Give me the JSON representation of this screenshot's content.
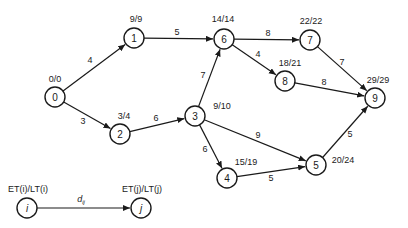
{
  "diagram": {
    "type": "activity-network",
    "nodes": [
      {
        "id": "0",
        "label": "0",
        "times": "0/0",
        "x": 55,
        "y": 97,
        "tx": 55,
        "ty": 79
      },
      {
        "id": "1",
        "label": "1",
        "times": "9/9",
        "x": 134,
        "y": 38,
        "tx": 136,
        "ty": 19
      },
      {
        "id": "2",
        "label": "2",
        "times": "3/4",
        "x": 120,
        "y": 134,
        "tx": 124,
        "ty": 116
      },
      {
        "id": "3",
        "label": "3",
        "times": "9/10",
        "x": 195,
        "y": 116,
        "tx": 222,
        "ty": 106
      },
      {
        "id": "4",
        "label": "4",
        "times": "15/19",
        "x": 227,
        "y": 178,
        "tx": 246,
        "ty": 162
      },
      {
        "id": "5",
        "label": "5",
        "times": "20/24",
        "x": 316,
        "y": 165,
        "tx": 343,
        "ty": 160
      },
      {
        "id": "6",
        "label": "6",
        "times": "14/14",
        "x": 224,
        "y": 39,
        "tx": 223,
        "ty": 19
      },
      {
        "id": "7",
        "label": "7",
        "times": "22/22",
        "x": 310,
        "y": 40,
        "tx": 311,
        "ty": 21
      },
      {
        "id": "8",
        "label": "8",
        "times": "18/21",
        "x": 285,
        "y": 81,
        "tx": 290,
        "ty": 63
      },
      {
        "id": "9",
        "label": "9",
        "times": "29/29",
        "x": 375,
        "y": 98,
        "tx": 378,
        "ty": 80
      }
    ],
    "edges": [
      {
        "from": "0",
        "to": "1",
        "duration": "4",
        "lx": 90,
        "ly": 60
      },
      {
        "from": "0",
        "to": "2",
        "duration": "3",
        "lx": 83,
        "ly": 121
      },
      {
        "from": "1",
        "to": "6",
        "duration": "5",
        "lx": 177,
        "ly": 32
      },
      {
        "from": "2",
        "to": "3",
        "duration": "6",
        "lx": 156,
        "ly": 118
      },
      {
        "from": "3",
        "to": "6",
        "duration": "7",
        "lx": 203,
        "ly": 75
      },
      {
        "from": "3",
        "to": "4",
        "duration": "6",
        "lx": 205,
        "ly": 149
      },
      {
        "from": "3",
        "to": "5",
        "duration": "9",
        "lx": 258,
        "ly": 135
      },
      {
        "from": "4",
        "to": "5",
        "duration": "5",
        "lx": 271,
        "ly": 178
      },
      {
        "from": "6",
        "to": "7",
        "duration": "8",
        "lx": 268,
        "ly": 33
      },
      {
        "from": "6",
        "to": "8",
        "duration": "4",
        "lx": 258,
        "ly": 54
      },
      {
        "from": "7",
        "to": "9",
        "duration": "7",
        "lx": 342,
        "ly": 62
      },
      {
        "from": "8",
        "to": "9",
        "duration": "8",
        "lx": 324,
        "ly": 82
      },
      {
        "from": "5",
        "to": "9",
        "duration": "5",
        "lx": 350,
        "ly": 134
      }
    ],
    "legend": {
      "node_i": {
        "label": "i",
        "times": "ET(i)/LT(i)",
        "x": 27,
        "y": 208
      },
      "node_j": {
        "label": "j",
        "times": "ET(j)/LT(j)",
        "x": 141,
        "y": 208
      },
      "edge_label": "dij",
      "edge_label_main": "d",
      "edge_label_sub": "ij"
    }
  }
}
